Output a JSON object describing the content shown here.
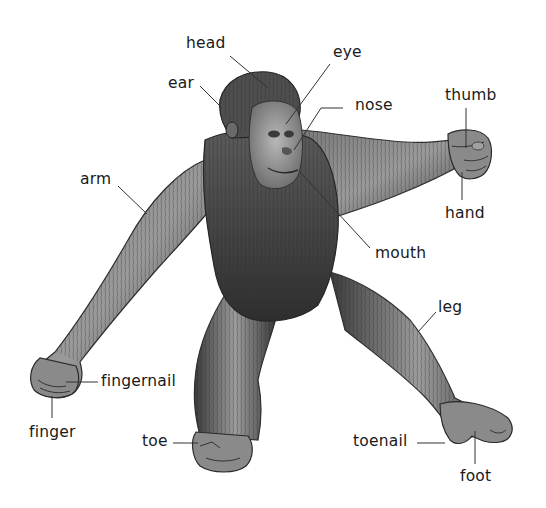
{
  "diagram": {
    "labels": [
      {
        "id": "head",
        "text": "head",
        "x": 186,
        "y": 36,
        "line": [
          230,
          56,
          268,
          88
        ]
      },
      {
        "id": "ear",
        "text": "ear",
        "x": 168,
        "y": 76,
        "line": [
          200,
          86,
          222,
          108
        ]
      },
      {
        "id": "eye",
        "text": "eye",
        "x": 333,
        "y": 45,
        "line": [
          330,
          64,
          286,
          124
        ]
      },
      {
        "id": "nose",
        "text": "nose",
        "x": 355,
        "y": 98,
        "line": [
          343,
          108,
          321,
          108,
          294,
          150
        ]
      },
      {
        "id": "thumb",
        "text": "thumb",
        "x": 445,
        "y": 88,
        "line": [
          466,
          108,
          466,
          148
        ]
      },
      {
        "id": "hand",
        "text": "hand",
        "x": 445,
        "y": 206,
        "line": [
          462,
          200,
          462,
          172
        ]
      },
      {
        "id": "arm",
        "text": "arm",
        "x": 80,
        "y": 172,
        "line": [
          118,
          186,
          147,
          214
        ]
      },
      {
        "id": "mouth",
        "text": "mouth",
        "x": 375,
        "y": 246,
        "line": [
          370,
          248,
          300,
          172
        ]
      },
      {
        "id": "leg",
        "text": "leg",
        "x": 438,
        "y": 300,
        "line": [
          436,
          312,
          418,
          332
        ]
      },
      {
        "id": "fingernail",
        "text": "fingernail",
        "x": 101,
        "y": 374,
        "line": [
          98,
          382,
          66,
          382
        ]
      },
      {
        "id": "finger",
        "text": "finger",
        "x": 29,
        "y": 425,
        "line": [
          52,
          418,
          52,
          396
        ]
      },
      {
        "id": "toe",
        "text": "toe",
        "x": 142,
        "y": 434,
        "line": [
          173,
          443,
          198,
          443
        ]
      },
      {
        "id": "toenail",
        "text": "toenail",
        "x": 353,
        "y": 434,
        "line": [
          417,
          443,
          445,
          443
        ]
      },
      {
        "id": "foot",
        "text": "foot",
        "x": 460,
        "y": 469,
        "line": [
          475,
          464,
          475,
          431
        ]
      }
    ]
  },
  "colors": {
    "background": "#ffffff",
    "fur_dark": "#3a3a3a",
    "fur_mid": "#6e6e6e",
    "fur_light": "#a8a8a8",
    "skin": "#8a8a8a",
    "leader_line": "#333333",
    "label_text": "#1a1a1a"
  }
}
